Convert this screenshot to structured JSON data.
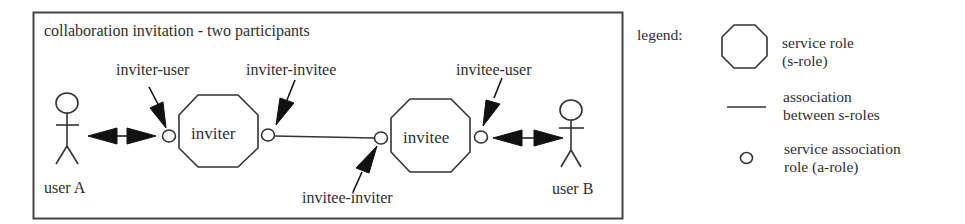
{
  "diagram": {
    "title": "collaboration invitation - two participants",
    "actors": [
      {
        "id": "userA",
        "label": "user A"
      },
      {
        "id": "userB",
        "label": "user B"
      }
    ],
    "service_roles": [
      {
        "id": "inviter",
        "label": "inviter"
      },
      {
        "id": "invitee",
        "label": "invitee"
      }
    ],
    "association_roles": [
      {
        "id": "inviter-user",
        "label": "inviter-user"
      },
      {
        "id": "inviter-invitee",
        "label": "inviter-invitee"
      },
      {
        "id": "invitee-inviter",
        "label": "invitee-inviter"
      },
      {
        "id": "invitee-user",
        "label": "invitee-user"
      }
    ]
  },
  "legend": {
    "title": "legend:",
    "items": [
      {
        "symbol": "octagon",
        "line1": "service role",
        "line2": "(s-role)"
      },
      {
        "symbol": "line",
        "line1": "association",
        "line2": "between s-roles"
      },
      {
        "symbol": "small-circle",
        "line1": "service association",
        "line2": "role (a-role)"
      }
    ]
  },
  "colors": {
    "stroke": "#333333",
    "background": "#ffffff"
  }
}
